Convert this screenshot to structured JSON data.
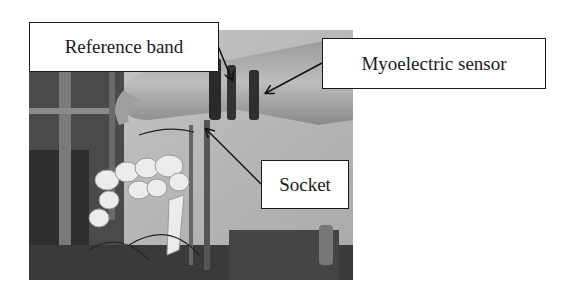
{
  "figure": {
    "labels": {
      "reference_band": "Reference band",
      "myoelectric_sensor": "Myoelectric sensor",
      "socket": "Socket"
    },
    "photo_description": "Grayscale photo of a robotic prosthetic hand attached to a human forearm with bands and sensor",
    "colors": {
      "background": "#ffffff",
      "box_border": "#1a1a1a",
      "arrow": "#111111"
    }
  }
}
